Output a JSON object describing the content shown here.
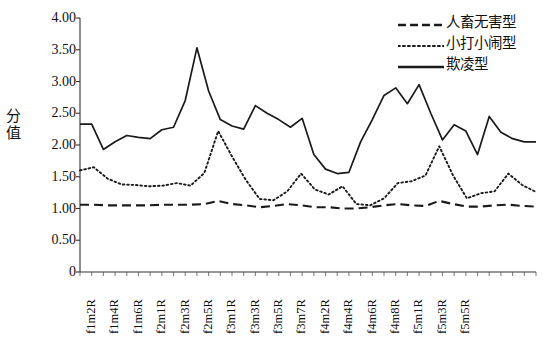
{
  "chart_data": {
    "type": "line",
    "title": "",
    "xlabel": "",
    "ylabel": "分值",
    "ylim": [
      0,
      4.0
    ],
    "yticks": [
      "0",
      "0.50",
      "1.00",
      "1.50",
      "2.00",
      "2.50",
      "3.00",
      "3.50",
      "4.00"
    ],
    "ytick_values": [
      0,
      0.5,
      1.0,
      1.5,
      2.0,
      2.5,
      3.0,
      3.5,
      4.0
    ],
    "grid": false,
    "legend_position": "top-right",
    "x_tick_labels": [
      "f1m2R",
      "f1m4R",
      "f1m6R",
      "f2m1R",
      "f2m3R",
      "f2m5R",
      "f3m1R",
      "f3m3R",
      "f3m5R",
      "f3m7R",
      "f4m2R",
      "f4m4R",
      "f4m6R",
      "f4m8R",
      "f5m1R",
      "f5m3R",
      "f5m5R"
    ],
    "x_label_stride": 2,
    "n_points": 34,
    "series": [
      {
        "name": "人畜无害型",
        "style": "dashed",
        "color": "#1a1a1a",
        "values": [
          1.06,
          1.06,
          1.05,
          1.05,
          1.05,
          1.05,
          1.06,
          1.06,
          1.06,
          1.07,
          1.12,
          1.07,
          1.05,
          1.02,
          1.04,
          1.07,
          1.05,
          1.02,
          1.02,
          1.0,
          1.0,
          1.02,
          1.05,
          1.07,
          1.05,
          1.04,
          1.12,
          1.07,
          1.03,
          1.03,
          1.05,
          1.06,
          1.04,
          1.03
        ]
      },
      {
        "name": "小打小闹型",
        "style": "dotted",
        "color": "#1a1a1a",
        "values": [
          1.6,
          1.65,
          1.47,
          1.38,
          1.37,
          1.35,
          1.36,
          1.4,
          1.36,
          1.56,
          2.22,
          1.82,
          1.45,
          1.15,
          1.13,
          1.27,
          1.55,
          1.3,
          1.22,
          1.35,
          1.07,
          1.05,
          1.16,
          1.4,
          1.43,
          1.52,
          1.98,
          1.52,
          1.16,
          1.24,
          1.27,
          1.55,
          1.37,
          1.26
        ]
      },
      {
        "name": "欺凌型",
        "style": "solid",
        "color": "#1a1a1a",
        "values": [
          2.33,
          2.33,
          1.93,
          2.05,
          2.15,
          2.12,
          2.1,
          2.24,
          2.28,
          2.7,
          3.53,
          2.85,
          2.4,
          2.3,
          2.25,
          2.62,
          2.5,
          2.4,
          2.28,
          2.42,
          1.85,
          1.62,
          1.55,
          1.57,
          2.05,
          2.4,
          2.78,
          2.9,
          2.65,
          2.95,
          2.5,
          2.08,
          2.32,
          2.22,
          1.85,
          2.45,
          2.2,
          2.1,
          2.05,
          2.05
        ]
      }
    ]
  },
  "axis": {
    "y_axis_title": "分值",
    "y_max_label": "4.00",
    "y_min_label": "0"
  },
  "legend": {
    "items": [
      {
        "label": "人畜无害型",
        "style": "dashed"
      },
      {
        "label": "小打小闹型",
        "style": "dotted"
      },
      {
        "label": "欺凌型",
        "style": "solid"
      }
    ]
  }
}
